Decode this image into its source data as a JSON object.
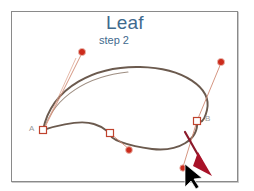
{
  "document": {
    "title": "Leaf",
    "subtitle": "step 2"
  },
  "canvas": {
    "label": "drawing-canvas",
    "background_color": "#ffffff",
    "border_color": "#8a8a8a"
  },
  "colors": {
    "title_text": "#3f6a8e",
    "path_stroke": "#6b5a4e",
    "anchor_stroke": "#c0432e",
    "control_point_fill": "#cc2b1c",
    "handle_line": "#d08a74",
    "annotation_arrow": "#8c1a2b",
    "cursor_fill": "#000000",
    "point_label": "#9a9a9a"
  },
  "annotations": {
    "arrow_name": "drag-direction-arrow",
    "cursor_name": "mouse-pointer"
  },
  "path_points": [
    {
      "id": "A",
      "label": "A",
      "type": "anchor",
      "x": 43,
      "y": 130
    },
    {
      "id": "M",
      "label": "",
      "type": "anchor",
      "x": 110,
      "y": 133
    },
    {
      "id": "B",
      "label": "B",
      "type": "anchor",
      "x": 197,
      "y": 121
    }
  ],
  "control_points": [
    {
      "id": "cp-top-left",
      "x": 82,
      "y": 52
    },
    {
      "id": "cp-bottom-mid",
      "x": 129,
      "y": 150
    },
    {
      "id": "cp-top-right",
      "x": 221,
      "y": 62
    },
    {
      "id": "cp-bottom-right",
      "x": 183,
      "y": 168
    }
  ]
}
